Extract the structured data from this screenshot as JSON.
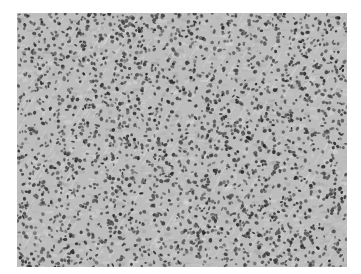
{
  "image": {
    "description": "Grayscale histology micrograph showing densely packed cells with dark nuclei",
    "style": "grayscale",
    "background_color": "#ffffff",
    "tissue_base_color": "#bdbdbd",
    "nucleus_color": "#3a3a3a",
    "bounds": {
      "x": 17,
      "y": 13,
      "width": 330,
      "height": 254
    }
  }
}
